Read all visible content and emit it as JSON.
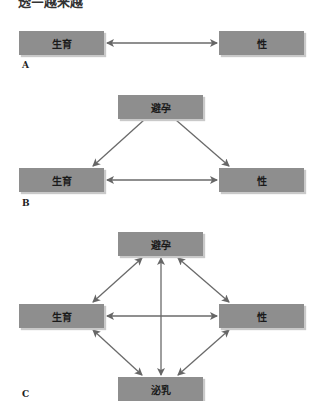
{
  "header": {
    "clipped_text": "透—越来越"
  },
  "panels": [
    {
      "label": "A",
      "nodes": {
        "left": "生育",
        "right": "性"
      },
      "edges": [
        [
          "生育",
          "性"
        ]
      ]
    },
    {
      "label": "B",
      "nodes": {
        "top": "避孕",
        "left": "生育",
        "right": "性"
      },
      "edges": [
        [
          "避孕",
          "生育"
        ],
        [
          "避孕",
          "性"
        ],
        [
          "生育",
          "性"
        ]
      ]
    },
    {
      "label": "C",
      "nodes": {
        "top": "避孕",
        "left": "生育",
        "right": "性",
        "bottom": "泌乳"
      },
      "edges": [
        [
          "避孕",
          "生育"
        ],
        [
          "避孕",
          "性"
        ],
        [
          "避孕",
          "泌乳"
        ],
        [
          "生育",
          "性"
        ],
        [
          "生育",
          "泌乳"
        ],
        [
          "性",
          "泌乳"
        ]
      ]
    }
  ],
  "colors": {
    "box": "#8e8e8e",
    "arrow": "#666666",
    "text": "#1a1a1a"
  }
}
